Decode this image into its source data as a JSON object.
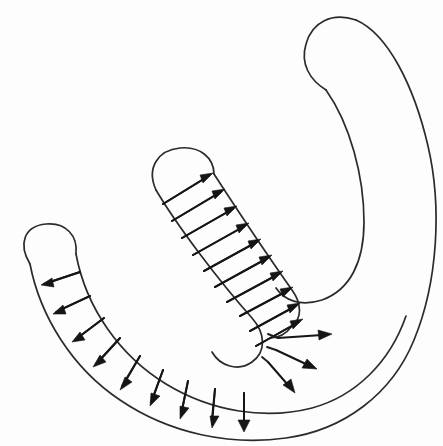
{
  "figure": {
    "background_color": "#fdfdfd",
    "stroke_color": "#2b2b2b",
    "arrow_color": "#151515",
    "width": 443,
    "height": 446,
    "style": "hand-drawn line art, no text labels"
  },
  "chart_data": {
    "type": "diagram",
    "title": "",
    "xlabel": "",
    "ylabel": "",
    "grid": false,
    "legend": null,
    "regions": [
      {
        "name": "upper-right-arm",
        "role": "arm of the horseshoe terminating in a rounded cap at top",
        "cap_center": [
          352,
          30
        ],
        "cap_radius": 42,
        "arrows": 0
      },
      {
        "name": "lower-left-arm",
        "role": "arm of the horseshoe terminating in a rounded cap at left",
        "cap_center": [
          47,
          252
        ],
        "cap_radius": 26,
        "arrows": 9
      },
      {
        "name": "inner-tongue",
        "role": "tongue-shaped lobe with rounded cap pointing upper-left",
        "cap_center": [
          180,
          172
        ],
        "cap_radius": 28,
        "arrows": 10
      },
      {
        "name": "elbow-fan",
        "role": "free radial arrows at the re-entrant corner",
        "origin": [
          274,
          340
        ],
        "arrows": 3
      }
    ],
    "arrow_groups": [
      {
        "name": "lower-left-band-normals",
        "count": 9,
        "direction": "outward, pointing away from the band interior (left then downward as the band curves)",
        "style": "solid line with filled triangular head"
      },
      {
        "name": "inner-tongue-normals",
        "count": 10,
        "direction": "outward to the upper-right, transverse across the tongue",
        "style": "solid line with filled triangular head"
      },
      {
        "name": "elbow-radial-fan",
        "count": 3,
        "direction": "radially outward to the right and lower-right",
        "style": "solid line with filled triangular head"
      }
    ],
    "total_arrows": 22
  },
  "geometry": {
    "outer_boundary_path": "M 27 258 C 18 238 30 223 48 223 C 66 223 74 238 72 252 C 90 320 140 390 222 424 C 300 452 372 420 410 350 C 436 300 444 210 428 140 C 414 76 392 26 358 16 C 326 6 306 26 306 48 C 306 70 322 84 336 92 C 360 120 372 176 372 226 C 372 268 356 296 326 304 C 300 310 282 298 274 282",
    "inner_boundary_path": "M 72 252 C 86 312 132 372 212 402 C 286 430 348 402 382 342 C 406 298 412 214 398 150 C 386 94 366 52 346 46",
    "tongue_left_path": "M 158 186 C 150 168 162 150 182 148 C 200 146 212 158 214 172 C 232 200 254 244 272 280 C 284 306 282 330 268 344 C 252 360 230 356 220 344",
    "tongue_right_path": "M 214 172 C 236 204 266 256 292 296 C 306 320 306 340 294 352",
    "notes": "Coordinates are approximate and expressed in the 443x446 image frame."
  },
  "accessibility": {
    "alt_text": "Line drawing of a horseshoe-shaped band with an inner tongue; short arrows along the boundaries point outward, representing an outward normal vector field."
  }
}
